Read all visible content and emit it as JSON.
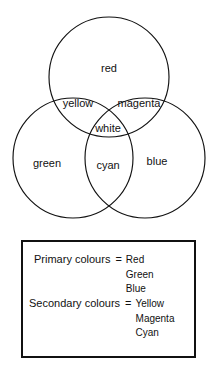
{
  "figure": {
    "circles": [
      {
        "name": "red-circle",
        "cx": 109,
        "cy": 77,
        "r": 60
      },
      {
        "name": "green-circle",
        "cx": 73,
        "cy": 158,
        "r": 60
      },
      {
        "name": "blue-circle",
        "cx": 145,
        "cy": 158,
        "r": 60
      }
    ],
    "labels": [
      {
        "name": "label-red",
        "text": "red",
        "x": 109,
        "y": 68
      },
      {
        "name": "label-yellow",
        "text": "yellow",
        "x": 78,
        "y": 103
      },
      {
        "name": "label-magenta",
        "text": "magenta",
        "x": 139,
        "y": 103
      },
      {
        "name": "label-white",
        "text": "white",
        "x": 108,
        "y": 128
      },
      {
        "name": "label-green",
        "text": "green",
        "x": 47,
        "y": 163
      },
      {
        "name": "label-cyan",
        "text": "cyan",
        "x": 108,
        "y": 165
      },
      {
        "name": "label-blue",
        "text": "blue",
        "x": 157,
        "y": 161
      }
    ]
  },
  "legend": {
    "primary": {
      "title": "Primary colours",
      "equals": "=",
      "values": [
        "Red",
        "Green",
        "Blue"
      ]
    },
    "secondary": {
      "title": "Secondary colours",
      "equals": "=",
      "values": [
        "Yellow",
        "Magenta",
        "Cyan"
      ]
    }
  },
  "colors": {
    "stroke": "#111111",
    "background": "#ffffff"
  }
}
